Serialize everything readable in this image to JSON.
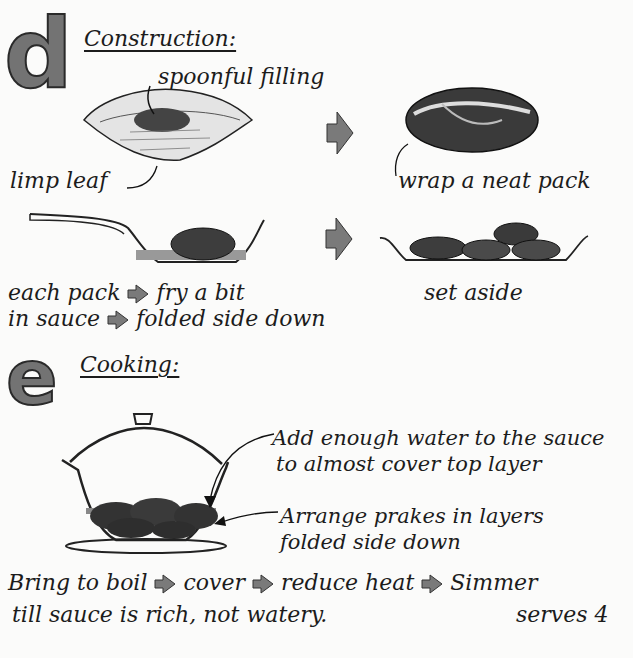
{
  "section_d": {
    "letter": "d",
    "heading": "Construction:",
    "labels": {
      "spoonful_filling": "spoonful filling",
      "limp_leaf": "limp leaf",
      "wrap_pack": "wrap a neat pack",
      "fry_line1": "each pack",
      "fry_line1b": "fry a bit",
      "fry_line2": "in sauce",
      "fry_line2b": "folded side down",
      "set_aside": "set aside"
    }
  },
  "section_e": {
    "letter": "e",
    "heading": "Cooking:",
    "labels": {
      "water_line1": "Add enough water to the sauce",
      "water_line2": "to almost cover top layer",
      "arrange_line1": "Arrange prakes in layers",
      "arrange_line2": "folded side down"
    },
    "instructions": {
      "step1": "Bring to boil",
      "step2": "cover",
      "step3": "reduce heat",
      "step4": "Simmer",
      "line2": "till sauce is rich, not watery.",
      "serves": "serves 4"
    }
  },
  "colors": {
    "letter_fill": "#737373",
    "arrow_fill": "#7a7a7a",
    "ink": "#1c1c1c",
    "paper": "#fbfbfa"
  }
}
